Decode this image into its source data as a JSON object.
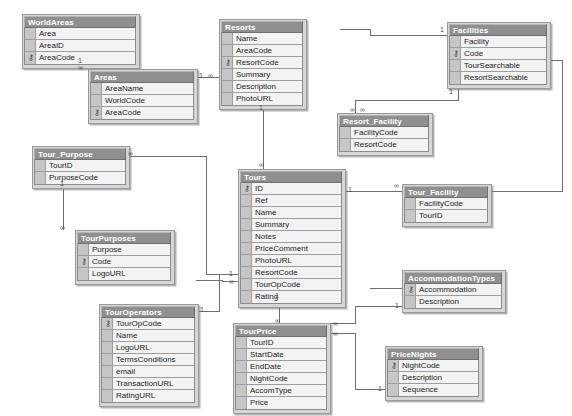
{
  "diagram": {
    "type": "entity-relationship-diagram",
    "background_color": "#ffffff",
    "table_header_color": "#8f8f8f",
    "table_body_color": "#d6d6d6",
    "field_cell_color": "#f3f3f3",
    "border_color": "#8c8c8c",
    "line_color": "#6e6e6e",
    "key_glyph": "⚷"
  },
  "tables": [
    {
      "name": "WorldAreas",
      "x": 22,
      "y": 14,
      "w": 118,
      "fields": [
        {
          "name": "Area",
          "pk": false
        },
        {
          "name": "AreaID",
          "pk": false
        },
        {
          "name": "AreaCode",
          "pk": true
        }
      ]
    },
    {
      "name": "Areas",
      "x": 88,
      "y": 69,
      "w": 110,
      "fields": [
        {
          "name": "AreaName",
          "pk": false
        },
        {
          "name": "WorldCode",
          "pk": false
        },
        {
          "name": "AreaCode",
          "pk": true
        }
      ]
    },
    {
      "name": "Resorts",
      "x": 219,
      "y": 19,
      "w": 88,
      "fields": [
        {
          "name": "Name",
          "pk": false
        },
        {
          "name": "AreaCode",
          "pk": false
        },
        {
          "name": "ResortCode",
          "pk": true
        },
        {
          "name": "Summary",
          "pk": false
        },
        {
          "name": "Description",
          "pk": false
        },
        {
          "name": "PhotoURL",
          "pk": false
        }
      ]
    },
    {
      "name": "Facilities",
      "x": 447,
      "y": 22,
      "w": 104,
      "fields": [
        {
          "name": "Facility",
          "pk": false
        },
        {
          "name": "Code",
          "pk": true
        },
        {
          "name": "TourSearchable",
          "pk": false
        },
        {
          "name": "ResortSearchable",
          "pk": false
        }
      ]
    },
    {
      "name": "Resort_Facility",
      "x": 337,
      "y": 113,
      "w": 96,
      "fields": [
        {
          "name": "FacilityCode",
          "pk": false
        },
        {
          "name": "ResortCode",
          "pk": false
        }
      ]
    },
    {
      "name": "Tour_Purpose",
      "x": 32,
      "y": 146,
      "w": 98,
      "fields": [
        {
          "name": "TourID",
          "pk": false
        },
        {
          "name": "PurposeCode",
          "pk": false
        }
      ]
    },
    {
      "name": "Tours",
      "x": 238,
      "y": 169,
      "w": 108,
      "fields": [
        {
          "name": "ID",
          "pk": true
        },
        {
          "name": "Ref",
          "pk": false
        },
        {
          "name": "Name",
          "pk": false
        },
        {
          "name": "Summary",
          "pk": false
        },
        {
          "name": "Notes",
          "pk": false
        },
        {
          "name": "PriceComment",
          "pk": false
        },
        {
          "name": "PhotoURL",
          "pk": false
        },
        {
          "name": "ResortCode",
          "pk": false
        },
        {
          "name": "TourOpCode",
          "pk": false
        },
        {
          "name": "Rating",
          "pk": false
        }
      ]
    },
    {
      "name": "Tour_Facility",
      "x": 402,
      "y": 184,
      "w": 90,
      "fields": [
        {
          "name": "FacilityCode",
          "pk": false
        },
        {
          "name": "TourID",
          "pk": false
        }
      ]
    },
    {
      "name": "TourPurposes",
      "x": 75,
      "y": 230,
      "w": 100,
      "fields": [
        {
          "name": "Purpose",
          "pk": false
        },
        {
          "name": "Code",
          "pk": true
        },
        {
          "name": "LogoURL",
          "pk": false
        }
      ]
    },
    {
      "name": "AccommodationTypes",
      "x": 402,
      "y": 270,
      "w": 104,
      "fields": [
        {
          "name": "Accommodation",
          "pk": true
        },
        {
          "name": "Description",
          "pk": false
        }
      ]
    },
    {
      "name": "TourOperators",
      "x": 99,
      "y": 304,
      "w": 100,
      "fields": [
        {
          "name": "TourOpCode",
          "pk": true
        },
        {
          "name": "Name",
          "pk": false
        },
        {
          "name": "LogoURL",
          "pk": false
        },
        {
          "name": "TermsConditions",
          "pk": false
        },
        {
          "name": "email",
          "pk": false
        },
        {
          "name": "TransactionURL",
          "pk": false
        },
        {
          "name": "RatingURL",
          "pk": false
        }
      ]
    },
    {
      "name": "TourPrice",
      "x": 233,
      "y": 323,
      "w": 98,
      "fields": [
        {
          "name": "TourID",
          "pk": false
        },
        {
          "name": "StartDate",
          "pk": false
        },
        {
          "name": "EndDate",
          "pk": false
        },
        {
          "name": "NightCode",
          "pk": false
        },
        {
          "name": "AccomType",
          "pk": false
        },
        {
          "name": "Price",
          "pk": false
        }
      ]
    },
    {
      "name": "PriceNights",
      "x": 385,
      "y": 346,
      "w": 98,
      "fields": [
        {
          "name": "NightCode",
          "pk": true
        },
        {
          "name": "Description",
          "pk": false
        },
        {
          "name": "Sequence",
          "pk": false
        }
      ]
    }
  ],
  "relationships": [
    {
      "from": "WorldAreas.AreaCode",
      "to": "Areas.WorldCode",
      "cardinality": "one-to-many"
    },
    {
      "from": "Areas.AreaCode",
      "to": "Resorts.AreaCode",
      "cardinality": "one-to-many"
    },
    {
      "from": "Resorts.ResortCode",
      "to": "Resort_Facility.ResortCode",
      "cardinality": "one-to-many"
    },
    {
      "from": "Resorts.ResortCode",
      "to": "Tours.ResortCode",
      "cardinality": "one-to-many"
    },
    {
      "from": "Facilities.Code",
      "to": "Resort_Facility.FacilityCode",
      "cardinality": "one-to-many"
    },
    {
      "from": "Facilities.Code",
      "to": "Tour_Facility.FacilityCode",
      "cardinality": "one-to-many"
    },
    {
      "from": "Tours.ID",
      "to": "Tour_Facility.TourID",
      "cardinality": "one-to-many"
    },
    {
      "from": "Tours.ID",
      "to": "Tour_Purpose.TourID",
      "cardinality": "one-to-many"
    },
    {
      "from": "Tours.ID",
      "to": "TourPrice.TourID",
      "cardinality": "one-to-many"
    },
    {
      "from": "TourPurposes.Code",
      "to": "Tour_Purpose.PurposeCode",
      "cardinality": "one-to-many"
    },
    {
      "from": "TourOperators.TourOpCode",
      "to": "Tours.TourOpCode",
      "cardinality": "one-to-many"
    },
    {
      "from": "AccommodationTypes.Accommodation",
      "to": "TourPrice.AccomType",
      "cardinality": "one-to-many"
    },
    {
      "from": "PriceNights.NightCode",
      "to": "TourPrice.NightCode",
      "cardinality": "one-to-many"
    }
  ]
}
